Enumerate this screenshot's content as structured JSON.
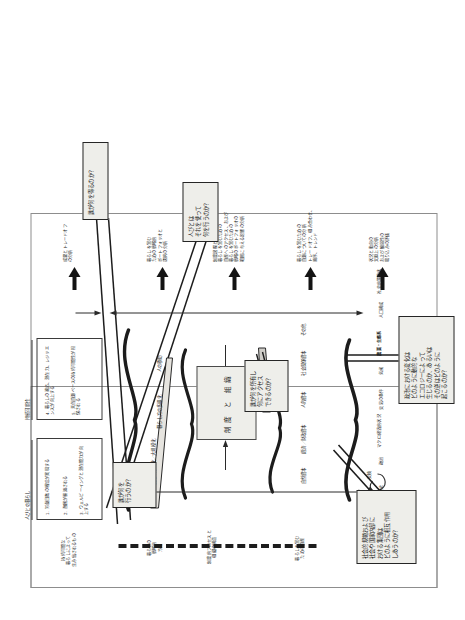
{
  "document": {
    "title": "人びとの暮らしと持続可能性の枠組み図",
    "orientation": "scanned page rotated 90 degrees (landscape content on portrait page)"
  },
  "center": {
    "line1": "制度",
    "line2": "と",
    "line3": "組織"
  },
  "livelihood_panel": {
    "heading": "人びとの暮らし",
    "items": [
      "1. 労働日数の増加が実現する",
      "2. 貧困が軽減される",
      "3. ウェルビーイングと潜在能力が向上する"
    ]
  },
  "sustainability_panel": {
    "heading": "持続可能性",
    "items": [
      "4. 暮らしの適応、潜在力、レジリエンスが向上する",
      "5. 天然資源ベースの持続可能性が担保される"
    ]
  },
  "brace_groups": {
    "outcomes": {
      "items": [
        "農業の集約化／大規模化",
        "暮らし方の多様化",
        "人の移動"
      ]
    },
    "capitals": {
      "items": [
        "自然資本",
        "経済／財政資本",
        "人的資本",
        "社会関係資本",
        "その他"
      ]
    },
    "context": {
      "items": [
        "歴史",
        "政治",
        "マクロ経済的状況",
        "交易の条件",
        "気候",
        "農業・生態系",
        "人口構成",
        "社会的趨勢化"
      ]
    }
  },
  "left_annotations": {
    "sustainable": "持続可能な\n暮らしによって\n生み出されるもの",
    "strategies": "暮らしの\n戦略的\n方策",
    "institutional": "制度的プロセスと\n組織の構造",
    "assets": "暮らしを営む\nための資産",
    "vulnerability": "脆弱\n状況\n動向",
    "feedback": "交換"
  },
  "right_annotations": {
    "r1": "成果とトレードオフ\nの分析",
    "r2": "暮らしを営む\nための戦略的\nポートフォリオと\n選択の分析",
    "r3": "制度過程と組織が\n暮らしを営むための\n資産へのアクセス、および\n暮らしを営むための\n戦略のポートフォリオの\n範囲に与える影響の分析",
    "r4": "暮らしを営むための\n資源についての分析\nトレードオフ、組み合わせ、\n順序、トレンド",
    "r5": "状況と動向の\n文脈上の分析\nおよび脆弱性の\n取り込みの評価"
  },
  "callouts": [
    {
      "id": "who-does-what",
      "text": "誰が何を\n行うのか？"
    },
    {
      "id": "who-owns-accesses",
      "text": "誰が何を所有し\n何にアクセス\nできるのか？"
    },
    {
      "id": "social-norms-groups",
      "text": "社会的規範および\n社会や国家内部に\nおける集団は\nどのように相互作用\nしあうのか？"
    },
    {
      "id": "politics-ecology-change",
      "text": "政治における変化は\nどのように動的な\nエコロジーによって\n生じるのか、あるいは\nその逆はどのように\n起こるのか？"
    },
    {
      "id": "who-gets-what",
      "text": "誰が何を得るのか？"
    },
    {
      "id": "what-people-do-with-it",
      "text": "人びとは\nそれを使って\n何を行うのか？"
    }
  ],
  "colors": {
    "box_fill": "#eeeeea",
    "box_stroke": "#262626",
    "frame_stroke": "#8d8d8d",
    "text": "#1a1a1a",
    "paper": "#ffffff"
  }
}
